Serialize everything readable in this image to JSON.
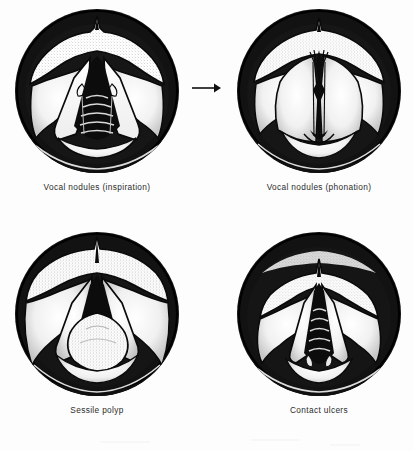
{
  "figure": {
    "kind": "laryngoscopic-views-plate",
    "background_color": "#fdfdfd",
    "ink_color": "#111111",
    "caption_color": "#2b2b2b",
    "transition_arrow": {
      "icon": "arrow-right-icon",
      "from_panel": "Vocal nodules (inspiration)",
      "to_panel": "Vocal nodules (phonation)"
    },
    "panels": [
      {
        "id": "vocal-nodules-inspiration",
        "caption": "Vocal nodules (inspiration)",
        "glottis_state": "open",
        "position": "top-left"
      },
      {
        "id": "vocal-nodules-phonation",
        "caption": "Vocal nodules (phonation)",
        "glottis_state": "closed",
        "position": "top-right"
      },
      {
        "id": "sessile-polyp",
        "caption": "Sessile polyp",
        "glottis_state": "open",
        "position": "bottom-left"
      },
      {
        "id": "contact-ulcers",
        "caption": "Contact ulcers",
        "glottis_state": "open",
        "position": "bottom-right"
      }
    ]
  }
}
